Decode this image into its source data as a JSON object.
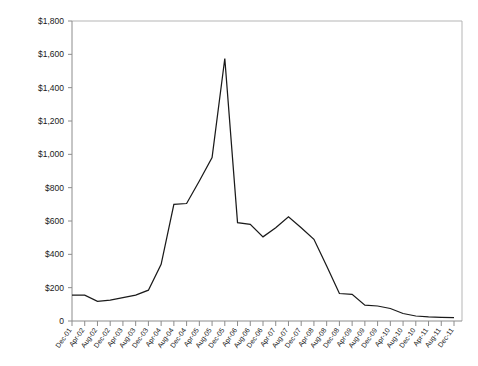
{
  "chart_data": {
    "type": "line",
    "title": "",
    "xlabel": "",
    "ylabel": "Nominal Price ($/ton)",
    "ylim": [
      0,
      1800
    ],
    "ytick_values": [
      0,
      200,
      400,
      600,
      800,
      1000,
      1200,
      1400,
      1600,
      1800
    ],
    "ytick_labels": [
      "0",
      "$200",
      "$400",
      "$600",
      "$800",
      "$1,000",
      "$1,200",
      "$1,400",
      "$1,600",
      "$1,800"
    ],
    "grid": false,
    "legend": null,
    "legend_position": "none",
    "categories": [
      "Dec-01",
      "Apr-02",
      "Aug-02",
      "Dec-02",
      "Apr-03",
      "Aug-03",
      "Dec-03",
      "Apr-04",
      "Aug-04",
      "Dec-04",
      "Apr-05",
      "Aug-05",
      "Dec-05",
      "Apr-06",
      "Aug-06",
      "Dec-06",
      "Apr-07",
      "Aug-07",
      "Dec-07",
      "Apr-08",
      "Aug-08",
      "Dec-08",
      "Apr-09",
      "Aug-09",
      "Dec-09",
      "Apr-10",
      "Aug-10",
      "Dec-10",
      "Apr-11",
      "Aug-11",
      "Dec-11"
    ],
    "values": [
      155,
      155,
      118,
      125,
      140,
      155,
      185,
      340,
      700,
      705,
      840,
      980,
      1575,
      590,
      580,
      505,
      560,
      625,
      560,
      490,
      330,
      165,
      160,
      95,
      90,
      75,
      45,
      30,
      25,
      22,
      20
    ],
    "series": [
      {
        "name": "Nominal Price",
        "values": [
          155,
          155,
          118,
          125,
          140,
          155,
          185,
          340,
          700,
          705,
          840,
          980,
          1575,
          590,
          580,
          505,
          560,
          625,
          560,
          490,
          330,
          165,
          160,
          95,
          90,
          75,
          45,
          30,
          25,
          22,
          20
        ]
      }
    ],
    "minor_ticks_per_interval": 4,
    "colors": {
      "series_line": "#1a1a1a",
      "axis": "#8c8c8c",
      "frame": "#b5b5b5",
      "text": "#1a1a1a",
      "background": "#ffffff"
    }
  }
}
